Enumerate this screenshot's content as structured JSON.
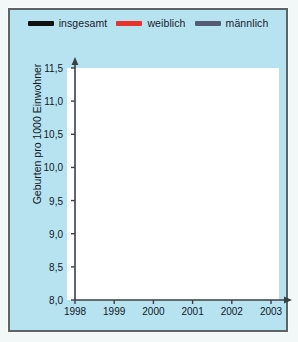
{
  "figure": {
    "panel_color": "#b7e3f0",
    "border_color": "#5d6468",
    "plot_background": "#ffffff",
    "grid_color": "#9aa1a6"
  },
  "legend": {
    "position": "top-center",
    "entries": [
      {
        "label": "insgesamt",
        "color": "#111111"
      },
      {
        "label": "weiblich",
        "color": "#e8332a"
      },
      {
        "label": "männlich",
        "color": "#545c74"
      }
    ]
  },
  "chart_data": {
    "type": "line",
    "title": "",
    "subtitle": "",
    "xlabel": "",
    "ylabel": "Geburten pro 1000 Einwohner",
    "categories": [
      "1998",
      "1999",
      "2000",
      "2001",
      "2002",
      "2003"
    ],
    "x": [
      1998,
      1999,
      2000,
      2001,
      2002,
      2003
    ],
    "xlim": [
      1998,
      2003
    ],
    "ylim": [
      8.0,
      11.5
    ],
    "ytick_step": 0.5,
    "ytick_labels": [
      "8,0",
      "8,5",
      "9,0",
      "9,5",
      "10,0",
      "10,5",
      "11,0",
      "11,5"
    ],
    "ytick_values": [
      8.0,
      8.5,
      9.0,
      9.5,
      10.0,
      10.5,
      11.0,
      11.5
    ],
    "xtick_labels": [
      "1998",
      "1999",
      "2000",
      "2001",
      "2002",
      "2003"
    ],
    "grid": "both",
    "decimal_separator": ",",
    "x_axis_arrow": true,
    "legend_position": "top",
    "series": [
      {
        "name": "insgesamt",
        "color": "#111111",
        "values": [
          10.5,
          10.2,
          9.9,
          9.4,
          9.2,
          9.0
        ]
      },
      {
        "name": "weiblich",
        "color": "#e8332a",
        "values": [
          9.95,
          9.6,
          9.5,
          8.9,
          8.75,
          8.6
        ]
      },
      {
        "name": "männlich",
        "color": "#545c74",
        "values": [
          11.15,
          10.8,
          10.4,
          9.9,
          9.65,
          9.4
        ]
      }
    ]
  }
}
